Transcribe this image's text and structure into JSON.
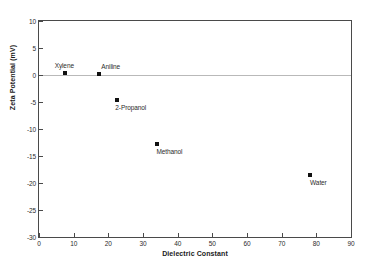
{
  "chart_data": {
    "type": "scatter",
    "title": "",
    "xlabel": "Dielectric Constant",
    "ylabel": "Zeta Potential (mV)",
    "xlim": [
      0,
      90
    ],
    "ylim": [
      -30,
      10
    ],
    "xticks": [
      0,
      10,
      20,
      30,
      40,
      50,
      60,
      70,
      80,
      90
    ],
    "yticks": [
      10,
      5,
      0,
      -5,
      -10,
      -15,
      -20,
      -25,
      -30
    ],
    "xtick_labels": [
      "0",
      "10",
      "20",
      "30",
      "40",
      "50",
      "60",
      "70",
      "80",
      "90"
    ],
    "ytick_labels": [
      "10",
      "5",
      "0",
      "-5",
      "-10",
      "-15",
      "-20",
      "-25",
      "-30"
    ],
    "grid": false,
    "legend": false,
    "reference_lines": [
      {
        "axis": "y",
        "value": 0,
        "color": "#b9b9b9"
      }
    ],
    "marker_color": "#111111",
    "marker_shape": "square",
    "points": [
      {
        "label": "Xylene",
        "x": 7.4,
        "y": 0.4,
        "label_dx": -10,
        "label_dy": -11
      },
      {
        "label": "Aniline",
        "x": 17.4,
        "y": 0.1,
        "label_dx": 2,
        "label_dy": -11
      },
      {
        "label": "2-Propanol",
        "x": 22.6,
        "y": -4.6,
        "label_dx": -2,
        "label_dy": 4
      },
      {
        "label": "Methanol",
        "x": 33.9,
        "y": -12.7,
        "label_dx": 0,
        "label_dy": 4
      },
      {
        "label": "Water",
        "x": 78.2,
        "y": -18.5,
        "label_dx": 0,
        "label_dy": 4
      }
    ]
  }
}
